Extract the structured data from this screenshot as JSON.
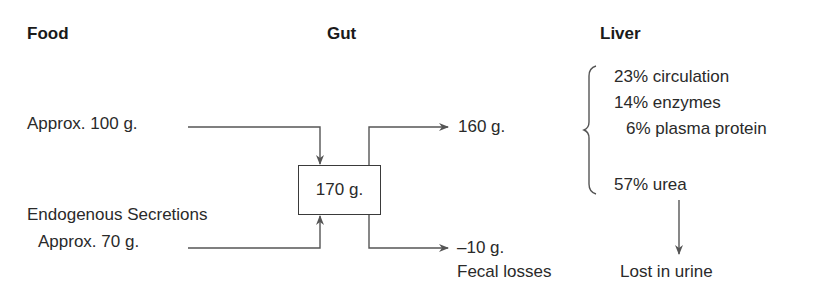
{
  "headers": {
    "food": "Food",
    "gut": "Gut",
    "liver": "Liver"
  },
  "inputs": {
    "food_amount": "Approx. 100 g.",
    "endogenous_label": "Endogenous Secretions",
    "endogenous_amount": "Approx. 70 g."
  },
  "gut": {
    "total": "170 g."
  },
  "outputs": {
    "absorbed": "160 g.",
    "fecal_amount": "–10 g.",
    "fecal_label": "Fecal losses"
  },
  "liver": {
    "items": [
      {
        "label": "23% circulation"
      },
      {
        "label": "14% enzymes"
      },
      {
        "label": "6% plasma protein"
      },
      {
        "label": "57% urea"
      }
    ],
    "urine_label": "Lost in urine"
  },
  "colors": {
    "line": "#555555",
    "text": "#2a2a2a"
  }
}
